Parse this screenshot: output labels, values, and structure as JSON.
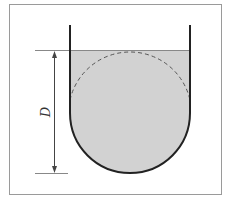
{
  "diagram": {
    "type": "u-tube-vessel-cross-section",
    "dimension_label": "D",
    "colors": {
      "frame": "#9a9a9a",
      "wall": "#222222",
      "liquid_fill": "#d2d2d2",
      "dashed_circle": "#555555",
      "dimension_line": "#444444",
      "reference_lines": "#888888"
    },
    "elements": {
      "vessel": "U-shaped container with two vertical walls and semicircular bottom",
      "liquid": "filled region up to the liquid surface",
      "inscribed_circle": "dashed circle of diameter D touching liquid surface and bottom",
      "dimension": "vertical double-headed arrow spanning liquid surface to vessel bottom, labelled D"
    }
  }
}
